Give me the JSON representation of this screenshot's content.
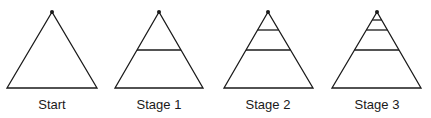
{
  "figure": {
    "stroke_color": "#1a1a1a",
    "panels": [
      {
        "label": "Start",
        "apex": [
          52,
          12
        ],
        "base_left": [
          7,
          88
        ],
        "base_right": [
          97,
          88
        ],
        "divider_ys": []
      },
      {
        "label": "Stage 1",
        "apex": [
          159,
          12
        ],
        "base_left": [
          115,
          88
        ],
        "base_right": [
          203,
          88
        ],
        "divider_ys": [
          50
        ]
      },
      {
        "label": "Stage 2",
        "apex": [
          268,
          12
        ],
        "base_left": [
          224,
          88
        ],
        "base_right": [
          313,
          88
        ],
        "divider_ys": [
          30,
          50
        ]
      },
      {
        "label": "Stage 3",
        "apex": [
          377,
          12
        ],
        "base_left": [
          332,
          88
        ],
        "base_right": [
          421,
          88
        ],
        "divider_ys": [
          20,
          30,
          50
        ]
      }
    ]
  }
}
